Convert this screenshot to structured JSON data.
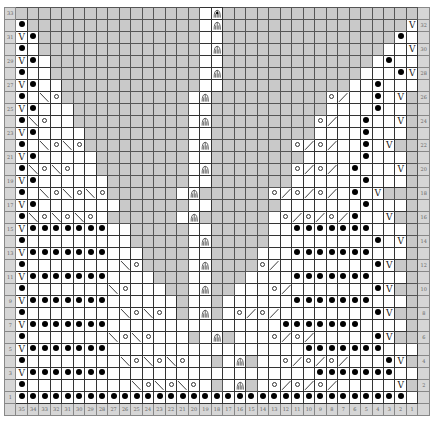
{
  "chart_data": {
    "type": "table",
    "title": "",
    "columns": 35,
    "rows": 33,
    "column_labels": [
      "35",
      "34",
      "33",
      "32",
      "31",
      "30",
      "29",
      "28",
      "27",
      "26",
      "25",
      "24",
      "23",
      "22",
      "21",
      "20",
      "19",
      "18",
      "17",
      "16",
      "15",
      "14",
      "13",
      "12",
      "11",
      "10",
      "9",
      "8",
      "7",
      "6",
      "5",
      "4",
      "3",
      "2",
      "1"
    ],
    "row_labels_left": "odd rows (1-33)",
    "row_labels_right": "even rows (2-32)",
    "legend": {
      "*": "purl (filled dot)",
      "V": "slip stitch",
      "o": "yarn over",
      "\\": "left-leaning decrease",
      "/": "right-leaning decrease",
      "A": "central double decrease",
      "B": "central double decrease with dot",
      "#": "no stitch (gray)",
      ".": "knit (blank)"
    },
    "grid": [
      "################.B#################",
      "*###############.A################V",
      "V*##############..###############*.",
      "*.##############.A##############..V",
      "V*.#############..#############.*..",
      "*..#############.A############...*V",
      "V*..############..###########..*...",
      "*.\\o###########.A##########o/..*.V",
      "V*...##########..##########....*..",
      "*\\o..##########.A#########o/..*..V",
      "V*....#########..#########....*...",
      "*.\\o\\o#########.A#######o/o/..*.V",
      "V*.....########..########.....*...",
      "*\\o\\o..########.A#######o/o/.*...V",
      "V*......#######..#######......*...",
      "*.\\o\\o\\o######.A######o/o/o/.*.V",
      "V*.......######..######.......*...",
      "*\\o\\o\\o.######.A######.o/o/o/*..V",
      "V*******..#####..#####..*******...",
      "*.........#####.A#####.........*.V",
      "V*******...####..####...*******...",
      "*........\\o####.A####o/........*V",
      "V*******....###..###....*******...",
      "*.......\\o...##.A##...o/.......*V",
      "V*******......#..#......*******...",
      "*........\\o\\o.#.A#.o/o/........*V",
      "V*******...............*******....",
      "*.......\\o\\o...#.A#...o/o/.....*V",
      "V*******.................*******...",
      "*........\\o\\o\\o..#.A#..o/o/o/...*V",
      "V*******..................*******..",
      "*.........\\o\\o\\o.#.A#.o/o/o/.....V",
      "**********************************."
    ]
  },
  "labels": {
    "row_numbers": [
      "33",
      "32",
      "31",
      "30",
      "29",
      "28",
      "27",
      "26",
      "25",
      "24",
      "23",
      "22",
      "21",
      "20",
      "19",
      "18",
      "17",
      "16",
      "15",
      "14",
      "13",
      "12",
      "11",
      "10",
      "9",
      "8",
      "7",
      "6",
      "5",
      "4",
      "3",
      "2",
      "1"
    ]
  }
}
